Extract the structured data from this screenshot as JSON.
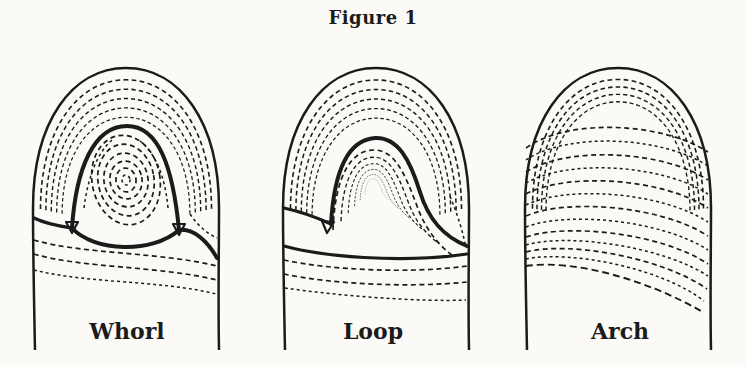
{
  "figure": {
    "title": "Figure 1"
  },
  "patterns": [
    {
      "label": "Whorl"
    },
    {
      "label": "Loop"
    },
    {
      "label": "Arch"
    }
  ],
  "colors": {
    "ink": "#1b1b1b",
    "paper": "#fbfaf7"
  }
}
